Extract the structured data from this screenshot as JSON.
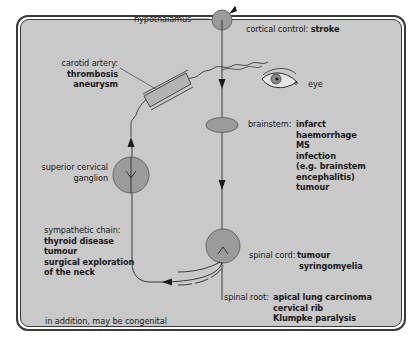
{
  "diagram": {
    "labels": {
      "hypothalamus": "hypothalamus",
      "cortical_control": {
        "label": "cortical control: ",
        "causes": [
          "stroke"
        ]
      },
      "carotid_artery": {
        "label": "carotid artery:",
        "causes": [
          "thrombosis",
          "aneurysm"
        ]
      },
      "eye": "eye",
      "brainstem": {
        "label": "brainstem:",
        "causes": [
          "infarct",
          "haemorrhage",
          "MS",
          "infection",
          "(e.g. brainstem",
          "encephalitis)",
          "tumour"
        ]
      },
      "superior_cervical_ganglion": {
        "line1": "superior cervical",
        "line2": "ganglion"
      },
      "sympathetic_chain": {
        "label": "sympathetic chain:",
        "causes": [
          "thyroid disease",
          "tumour",
          "surgical exploration",
          "of the neck"
        ]
      },
      "spinal_cord": {
        "label": "spinal cord: ",
        "causes": [
          "tumour",
          "syringomyelia"
        ]
      },
      "spinal_root": {
        "label": "spinal root: ",
        "causes": [
          "apical lung carcinoma",
          "cervical rib",
          "Klumpke paralysis"
        ]
      },
      "footnote": "in addition, may be congenital"
    },
    "colors": {
      "panel": "#c9c9c9",
      "node_fill": "#9b9b9b",
      "line": "#2a2a2a",
      "frame": "#3a3a3a"
    }
  }
}
